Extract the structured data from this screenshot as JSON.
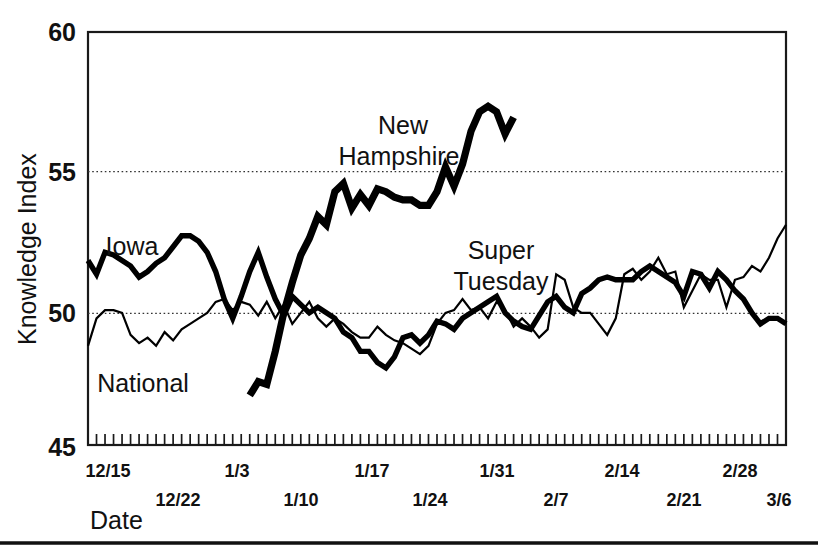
{
  "chart_data": {
    "type": "line",
    "title": "",
    "xlabel": "Date",
    "ylabel": "Knowledge Index",
    "ylim": [
      45,
      60
    ],
    "yticks": [
      45,
      50,
      55,
      60
    ],
    "ytick_labels": [
      "45",
      "50",
      "55",
      "60"
    ],
    "gridlines": [
      50,
      55
    ],
    "grid": "horizontal-dotted",
    "legend_position": "inline-labels",
    "x_axis": {
      "tick_count": 83,
      "tick_interval_days": 1,
      "labeled_ticks": [
        "12/15",
        "12/22",
        "1/3",
        "1/10",
        "1/17",
        "1/24",
        "1/31",
        "2/7",
        "2/14",
        "2/21",
        "2/28",
        "3/6"
      ],
      "label_rows": [
        [
          "12/15",
          "1/3",
          "1/17",
          "1/31",
          "2/14",
          "2/28"
        ],
        [
          "12/22",
          "1/10",
          "1/24",
          "2/7",
          "2/21",
          "3/6"
        ]
      ],
      "start_label": "12/15",
      "end_label": "3/6"
    },
    "annotations": [
      {
        "text": "New",
        "x": 403,
        "y": 126
      },
      {
        "text": "Hampshire",
        "x": 399,
        "y": 157
      },
      {
        "text": "Iowa",
        "x": 132,
        "y": 248
      },
      {
        "text": "National",
        "x": 95,
        "y": 385
      },
      {
        "text": "Super",
        "x": 474,
        "y": 251
      },
      {
        "text": "Tuesday",
        "x": 466,
        "y": 281
      }
    ],
    "series": [
      {
        "name": "National",
        "style": "thin",
        "label": "National",
        "values": [
          48.6,
          49.6,
          49.9,
          49.9,
          49.8,
          49.0,
          48.7,
          48.9,
          48.6,
          49.1,
          48.8,
          49.2,
          49.4,
          49.6,
          49.8,
          50.2,
          50.3,
          49.9,
          50.2,
          50.1,
          49.7,
          50.2,
          49.6,
          50.1,
          49.4,
          49.8,
          50.2,
          49.6,
          49.3,
          49.6,
          49.4,
          49.1,
          48.9,
          48.9,
          49.3,
          49.0,
          48.8,
          48.7,
          48.5,
          48.3,
          48.6,
          49.4,
          49.8,
          49.9,
          50.3,
          49.9,
          50.0,
          49.6,
          50.2,
          49.9,
          49.3,
          49.6,
          49.3,
          48.9,
          49.2,
          51.2,
          51.0,
          50.0,
          49.8,
          49.8,
          49.4,
          49.0,
          49.6,
          51.2,
          51.4,
          51.0,
          51.3,
          51.8,
          51.2,
          51.3,
          50.0,
          50.6,
          51.2,
          51.0,
          51.0,
          50.0,
          51.0,
          51.1,
          51.5,
          51.3,
          51.8,
          52.5,
          53.0
        ]
      },
      {
        "name": "Iowa",
        "style": "medium",
        "label": "Iowa",
        "values": [
          51.7,
          51.2,
          52.0,
          51.9,
          51.7,
          51.5,
          51.1,
          51.3,
          51.6,
          51.8,
          52.2,
          52.6,
          52.6,
          52.4,
          52.0,
          51.3,
          50.3,
          49.6,
          50.4,
          51.3,
          52.0,
          51.1,
          50.3,
          49.7,
          50.4,
          50.1,
          49.8,
          50.0,
          49.8,
          49.6,
          49.1,
          48.9,
          48.4,
          48.4,
          48.0,
          47.8,
          48.2,
          48.9,
          49.0,
          48.7,
          49.0,
          49.5,
          49.4,
          49.2,
          49.6,
          49.8,
          50.0,
          50.2,
          50.4,
          49.8,
          49.5,
          49.3,
          49.2,
          49.7,
          50.2,
          50.4,
          50.0,
          49.8,
          50.5,
          50.7,
          51.0,
          51.1,
          51.0,
          51.0,
          51.0,
          51.3,
          51.5,
          51.3,
          51.1,
          50.9,
          50.4,
          51.3,
          51.2,
          50.7,
          51.3,
          51.0,
          50.6,
          50.3,
          49.8,
          49.4,
          49.6,
          49.6,
          49.4
        ]
      },
      {
        "name": "New Hampshire",
        "style": "thick",
        "label": "New Hampshire",
        "start_index": 19,
        "end_index": 48,
        "values": [
          46.8,
          47.3,
          47.2,
          48.4,
          49.8,
          50.9,
          51.9,
          52.5,
          53.3,
          53.0,
          54.2,
          54.5,
          53.6,
          54.1,
          53.7,
          54.3,
          54.2,
          54.0,
          53.9,
          53.9,
          53.7,
          53.7,
          54.2,
          55.1,
          54.4,
          55.2,
          56.4,
          57.1,
          57.3,
          57.1,
          56.3,
          56.9
        ]
      }
    ]
  },
  "layout": {
    "plot_left": 88,
    "plot_right": 786,
    "plot_top": 32,
    "plot_bottom": 445
  },
  "axis": {
    "y_title": "Knowledge Index",
    "x_title": "Date"
  }
}
